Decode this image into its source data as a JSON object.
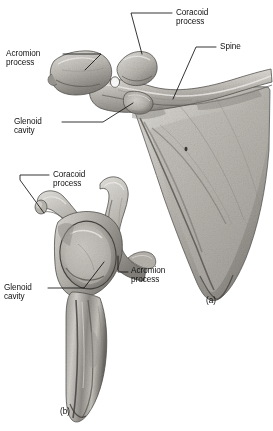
{
  "figure": {
    "background_color": "#ffffff",
    "ink_color": "#111111",
    "bone_light": "#e8e6e2",
    "bone_mid": "#b5b2ac",
    "bone_dark": "#6f6c67",
    "bone_shadow": "#46433f",
    "truncated_text_top": "nerus.",
    "views": [
      {
        "caption": "(a)",
        "view_name": "posterior-view-scapula",
        "labels": [
          {
            "id": "coracoid-process",
            "line1": "Coracoid",
            "line2": "process"
          },
          {
            "id": "spine",
            "line1": "Spine",
            "line2": ""
          },
          {
            "id": "acromion-process",
            "line1": "Acromion",
            "line2": "process"
          },
          {
            "id": "glenoid-cavity",
            "line1": "Glenoid",
            "line2": "cavity"
          }
        ]
      },
      {
        "caption": "(b)",
        "view_name": "lateral-view-scapula",
        "labels": [
          {
            "id": "coracoid-process",
            "line1": "Coracoid",
            "line2": "process"
          },
          {
            "id": "glenoid-cavity",
            "line1": "Glenoid",
            "line2": "cavity"
          },
          {
            "id": "acromion-process",
            "line1": "Acromion",
            "line2": "process"
          }
        ]
      }
    ]
  },
  "labels_flat": {
    "a_coracoid_l1": "Coracoid",
    "a_coracoid_l2": "process",
    "a_spine": "Spine",
    "a_acromion_l1": "Acromion",
    "a_acromion_l2": "process",
    "a_glenoid_l1": "Glenoid",
    "a_glenoid_l2": "cavity",
    "a_caption": "(a)",
    "b_coracoid_l1": "Coracoid",
    "b_coracoid_l2": "process",
    "b_glenoid_l1": "Glenoid",
    "b_glenoid_l2": "cavity",
    "b_acromion_l1": "Acromion",
    "b_acromion_l2": "process",
    "b_caption": "(b)",
    "top_cutoff": "nerus."
  }
}
